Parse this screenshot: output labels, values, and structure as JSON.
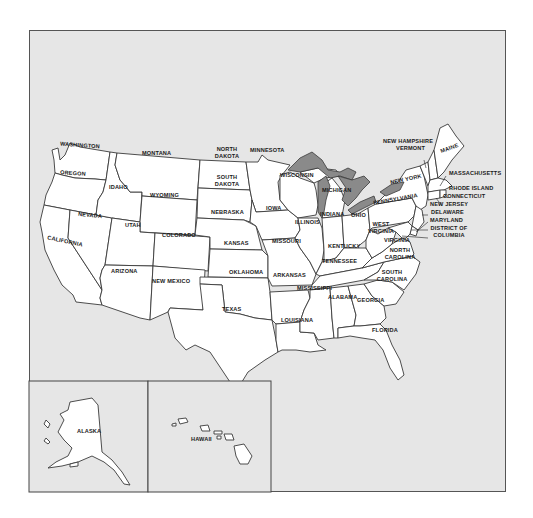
{
  "map": {
    "type": "political outline map",
    "region": "United States",
    "background_color": "#e6e6e6",
    "land_color": "#ffffff",
    "lake_color": "#8a8a8a",
    "border_color": "#3a3a3a"
  },
  "states": {
    "washington": "WASHINGTON",
    "oregon": "OREGON",
    "california": "CALIFORNIA",
    "nevada": "NEVADA",
    "idaho": "IDAHO",
    "montana": "MONTANA",
    "wyoming": "WYOMING",
    "utah": "UTAH",
    "arizona": "ARIZONA",
    "colorado": "COLORADO",
    "new_mexico": "NEW MEXICO",
    "north_dakota": "NORTH DAKOTA",
    "south_dakota": "SOUTH DAKOTA",
    "nebraska": "NEBRASKA",
    "kansas": "KANSAS",
    "oklahoma": "OKLAHOMA",
    "texas": "TEXAS",
    "minnesota": "MINNESOTA",
    "iowa": "IOWA",
    "missouri": "MISSOURI",
    "arkansas": "ARKANSAS",
    "louisiana": "LOUISIANA",
    "wisconsin": "WISCONSIN",
    "illinois": "ILLINOIS",
    "michigan": "MICHIGAN",
    "indiana": "INDIANA",
    "ohio": "OHIO",
    "kentucky": "KENTUCKY",
    "tennessee": "TENNESSEE",
    "mississippi": "MISSISSIPPI",
    "alabama": "ALABAMA",
    "georgia": "GEORGIA",
    "florida": "FLORIDA",
    "south_carolina": "SOUTH CAROLINA",
    "north_carolina": "NORTH CAROLINA",
    "virginia": "VIRGINIA",
    "west_virginia": "WEST VIRGINIA",
    "pennsylvania": "PENNSYLVANIA",
    "new_york": "NEW YORK",
    "maine": "MAINE",
    "new_hampshire": "NEW HAMPSHIRE",
    "vermont": "VERMONT",
    "massachusetts": "MASSACHUSETTS",
    "rhode_island": "RHODE ISLAND",
    "connecticut": "CONNECTICUT",
    "new_jersey": "NEW JERSEY",
    "delaware": "DELAWARE",
    "maryland": "MARYLAND",
    "district_of_columbia": "DISTRICT OF COLUMBIA"
  },
  "insets": {
    "alaska": "ALASKA",
    "hawaii": "HAWAII"
  }
}
